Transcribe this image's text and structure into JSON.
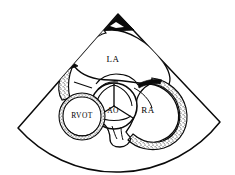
{
  "figure": {
    "modality": "2D echocardiography sector scan",
    "style": "black and white line drawing with stippled myocardial walls",
    "background_color": "#ffffff",
    "ink_color": "#0a0a0a"
  },
  "sector": {
    "name": "ultrasound-sector-scan",
    "apex": {
      "x": 118,
      "y": 14
    },
    "left_edge_end": {
      "x": 18,
      "y": 128
    },
    "right_edge_end": {
      "x": 220,
      "y": 122
    },
    "arc_bottom": {
      "x": 120,
      "y": 152
    },
    "outline_color": "#0a0a0a"
  },
  "labels": [
    {
      "id": "la",
      "text": "LA",
      "name": "label-left-atrium",
      "x": 113,
      "y": 62,
      "size": "normal"
    },
    {
      "id": "ao",
      "text": "AO",
      "name": "label-aorta",
      "x": 113,
      "y": 113,
      "size": "small"
    },
    {
      "id": "rvot",
      "text": "RVOT",
      "name": "label-right-ventricular-outflow-tract",
      "x": 82,
      "y": 118,
      "size": "small"
    },
    {
      "id": "ra",
      "text": "RA",
      "name": "label-right-atrium",
      "x": 148,
      "y": 113,
      "size": "normal"
    }
  ],
  "structures": [
    {
      "id": "la",
      "label": "LA",
      "full_name": "Left atrium",
      "description": "Large upper chamber bounded above by the sector apex region"
    },
    {
      "id": "ao",
      "label": "AO",
      "full_name": "Aorta / aortic valve",
      "description": "Central circular aortic root showing trileaflet valve cusps"
    },
    {
      "id": "rvot",
      "label": "RVOT",
      "full_name": "Right ventricular outflow tract",
      "description": "Circular structure at lower left with stippled wall"
    },
    {
      "id": "ra",
      "label": "RA",
      "full_name": "Right atrium",
      "description": "Chamber at lower right bounded by stippled lateral wall"
    }
  ],
  "annotations": {
    "apex_marker": "dark triangular near-field artifact at sector apex",
    "valve_cusps": 3,
    "connecting_channel": "narrow channel between RVOT and RA at inferior margin"
  }
}
